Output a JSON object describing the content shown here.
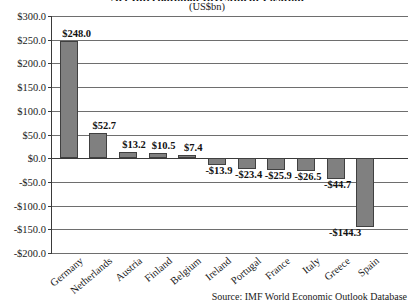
{
  "chart_data": {
    "type": "bar",
    "title": "Net International Investment Position",
    "subtitle": "(US$bn)",
    "xlabel": "",
    "ylabel": "",
    "ylim": [
      -200.0,
      300.0
    ],
    "ytick_step": 50.0,
    "grid": true,
    "legend": null,
    "categories": [
      "Germany",
      "Netherlands",
      "Austria",
      "Finland",
      "Belgium",
      "Ireland",
      "Portugal",
      "France",
      "Italy",
      "Greece",
      "Spain"
    ],
    "values": [
      248.0,
      52.7,
      13.2,
      10.5,
      7.4,
      -13.9,
      -23.4,
      -25.9,
      -26.5,
      -44.7,
      -144.3
    ],
    "data_labels": [
      "$248.0",
      "$52.7",
      "$13.2",
      "$10.5",
      "$7.4",
      "-$13.9",
      "-$23.4",
      "-$25.9",
      "-$26.5",
      "-$44.7",
      "-$144.3"
    ],
    "ytick_labels": [
      "$300.0",
      "$250.0",
      "$200.0",
      "$150.0",
      "$100.0",
      "$50.0",
      "$0.0",
      "-$50.0",
      "-$100.0",
      "-$150.0",
      "-$200.0"
    ],
    "ytick_values": [
      300.0,
      250.0,
      200.0,
      150.0,
      100.0,
      50.0,
      0.0,
      -50.0,
      -100.0,
      -150.0,
      -200.0
    ],
    "source": "Source: IMF World Economic Outlook Database",
    "bar_color": "#808080",
    "bar_border_color": "#404040",
    "grid_color": "#6e6e6e",
    "axis_color": "#3a3a3a"
  }
}
